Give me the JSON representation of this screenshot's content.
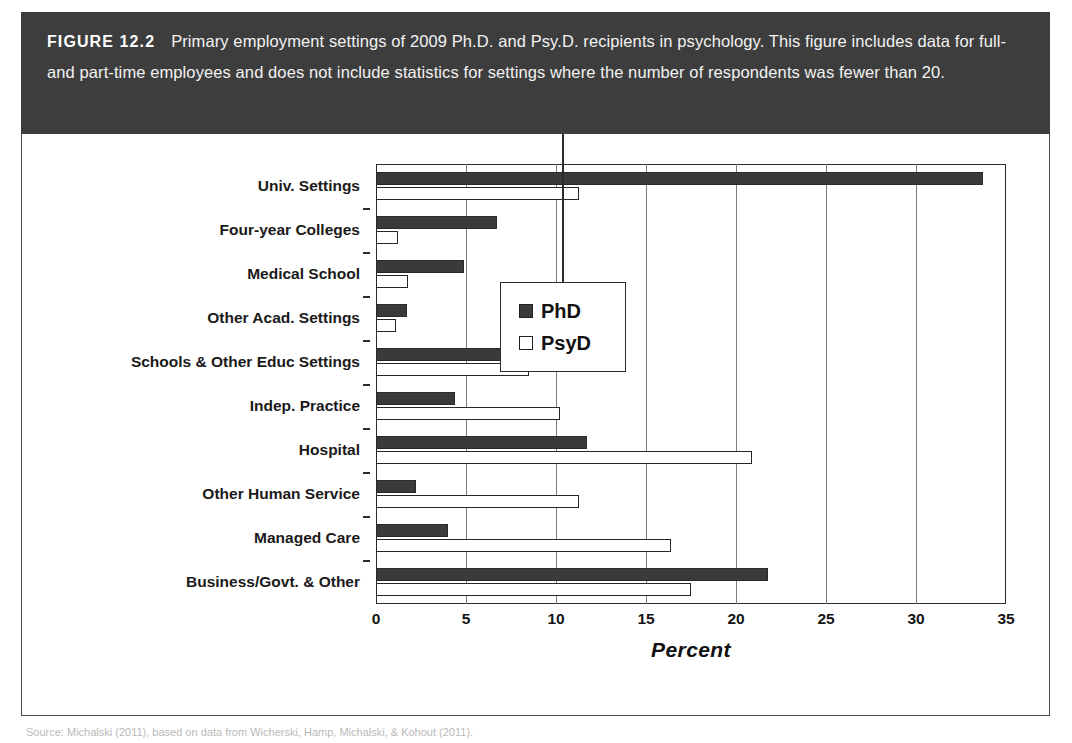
{
  "figure": {
    "number_label": "FIGURE 12.2",
    "caption": "Primary employment settings of 2009 Ph.D. and Psy.D. recipients in psychology. This figure includes data for full- and part-time employees and does not include statistics for settings where the number of respondents was fewer than 20.",
    "source_note": "Source: Michalski (2011), based on data from Wicherski, Hamp, Michalski, & Kohout (2011).",
    "colors": {
      "band_background": "#3d3d3d",
      "band_text": "#f2f2f2",
      "panel_background": "#ffffff",
      "panel_border": "#4a4a4a",
      "axis": "#2b2b2b",
      "gridline": "#7a7a7a",
      "phd_fill": "#3a3a3a",
      "psyd_fill": "#ffffff",
      "psyd_border": "#262626"
    }
  },
  "chart_data": {
    "type": "bar",
    "orientation": "horizontal",
    "title": "",
    "subtitle": "",
    "xlabel": "Percent",
    "ylabel": "",
    "xlim": [
      0,
      35
    ],
    "xticks": [
      0,
      5,
      10,
      15,
      20,
      25,
      30,
      35
    ],
    "xtick_labels": [
      "0",
      "5",
      "10",
      "15",
      "20",
      "25",
      "30",
      "35"
    ],
    "grid": true,
    "grid_axis": "x",
    "legend_position": "upper right (inside plot)",
    "categories": [
      "Univ. Settings",
      "Four-year Colleges",
      "Medical School",
      "Other Acad. Settings",
      "Schools & Other Educ Settings",
      "Indep. Practice",
      "Hospital",
      "Other Human Service",
      "Managed Care",
      "Business/Govt. & Other"
    ],
    "series": [
      {
        "name": "PhD",
        "values": [
          33.7,
          6.7,
          4.9,
          1.7,
          9.1,
          4.4,
          11.7,
          2.2,
          4.0,
          21.8
        ]
      },
      {
        "name": "PsyD",
        "values": [
          11.3,
          1.2,
          1.8,
          1.1,
          8.5,
          10.2,
          20.9,
          11.3,
          16.4,
          17.5
        ]
      }
    ]
  },
  "legend": {
    "items": [
      {
        "label": "PhD",
        "swatch": "filled-dark-square"
      },
      {
        "label": "PsyD",
        "swatch": "open-white-square"
      }
    ]
  }
}
